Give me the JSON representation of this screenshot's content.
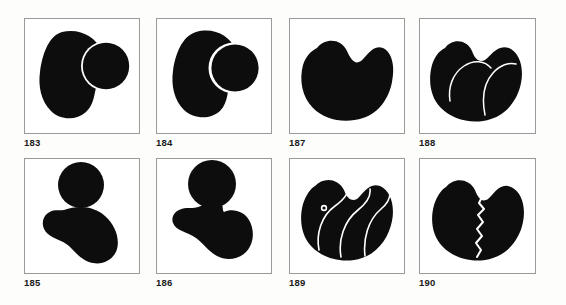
{
  "plate": {
    "background_color": "#fdfdfc",
    "panel_background": "#ffffff",
    "frame_color": "#9a9a98",
    "ink_color": "#0d0d0d",
    "cut_color": "#ffffff",
    "rows": 2,
    "columns": 4,
    "panel_count": 8
  },
  "panels": [
    {
      "caption": "183",
      "description": "large dark blob with an overlapping circle on the right separated by a thin white arc",
      "parts": 2,
      "cut_lines": 1,
      "dot": false
    },
    {
      "caption": "184",
      "description": "dark blob with a circle pressed deeply into its right side forming a concave notch",
      "parts": 2,
      "cut_lines": 1,
      "dot": false
    },
    {
      "caption": "187",
      "description": "solid kidney bean shape with a notch at the top center",
      "parts": 1,
      "cut_lines": 0,
      "dot": false
    },
    {
      "caption": "188",
      "description": "bean shape with two bumps on top divided into three lobes by thin white arcs",
      "parts": 3,
      "cut_lines": 2,
      "dot": false
    },
    {
      "caption": "185",
      "description": "separate circle floating above a kidney bean shape",
      "parts": 2,
      "cut_lines": 0,
      "dot": false
    },
    {
      "caption": "186",
      "description": "circle joined to the kidney bean below through a narrow neck",
      "parts": 1,
      "cut_lines": 0,
      "dot": false
    },
    {
      "caption": "189",
      "description": "heart shaped blob divided by three curved white lines with a small white dot in the upper left lobe",
      "parts": 4,
      "cut_lines": 3,
      "dot": true
    },
    {
      "caption": "190",
      "description": "heart shaped blob split down the middle by a jagged white crack",
      "parts": 2,
      "cut_lines": 1,
      "dot": false
    }
  ]
}
